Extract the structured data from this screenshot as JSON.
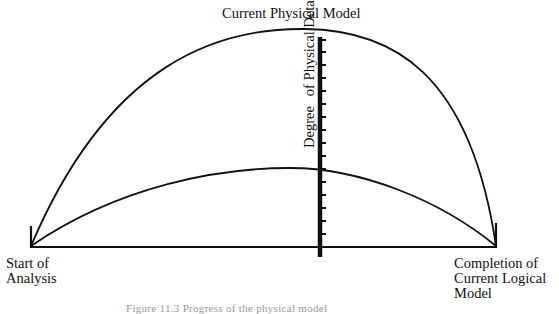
{
  "diagram": {
    "top_label": "Current Physical Model",
    "start_label_line1": "Start of",
    "start_label_line2": "Analysis",
    "end_label_line1": "Completion of",
    "end_label_line2": "Current Logical",
    "end_label_line3": "Model",
    "axis_label_part1": "Degree",
    "axis_label_part2": "of Physical Detail",
    "caption": "Figure 11.3  Progress of the physical model"
  },
  "geometry": {
    "baseline_y": 247,
    "start_x": 31,
    "end_x": 496,
    "axis_x": 320,
    "axis_top_y": 37,
    "axis_bottom_y": 257,
    "upper_curve_peak": [
      305,
      30
    ],
    "lower_curve_peak": [
      290,
      168
    ],
    "tick_count": 17
  },
  "colors": {
    "ink": "#111111",
    "background": "#ffffff"
  }
}
